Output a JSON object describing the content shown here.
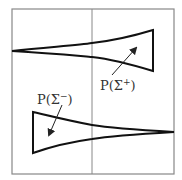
{
  "diagram": {
    "colors": {
      "frame": "#888888",
      "shape": "#111111",
      "label": "#333333",
      "background": "#ffffff"
    },
    "labels": {
      "sigma_plus": {
        "prefix": "P(Σ",
        "sup": "+",
        "suffix": ")"
      },
      "sigma_minus": {
        "prefix": "P(Σ",
        "sup": "−",
        "suffix": ")"
      }
    }
  }
}
